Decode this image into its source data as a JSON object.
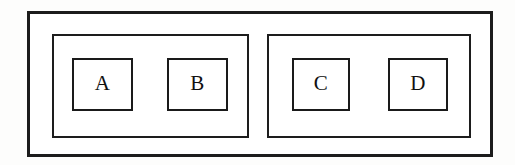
{
  "diagram": {
    "background_color": "#fdfdfc",
    "stroke_color": "#1c1c1c",
    "fill_color": "#ffffff",
    "outer_frame": {
      "name": "outer-frame",
      "label": ""
    },
    "groups": [
      {
        "name": "group-left",
        "label": "",
        "boxes": [
          {
            "name": "box-a",
            "label": "A"
          },
          {
            "name": "box-b",
            "label": "B"
          }
        ]
      },
      {
        "name": "group-right",
        "label": "",
        "boxes": [
          {
            "name": "box-c",
            "label": "C"
          },
          {
            "name": "box-d",
            "label": "D"
          }
        ]
      }
    ]
  }
}
